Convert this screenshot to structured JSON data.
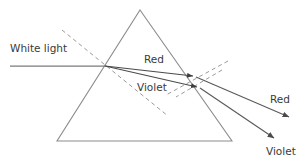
{
  "figure": {
    "type": "optics-ray-diagram",
    "width": 306,
    "height": 161,
    "background_color": "#ffffff"
  },
  "colors": {
    "prism_outline": "#8c8c8c",
    "ray_line": "#6b6b6b",
    "inner_ray_line": "#4a4a4a",
    "dashed_normal": "#9a9a9a",
    "text": "#3a3a3a"
  },
  "labels": {
    "white_light": "White light",
    "red_inside": "Red",
    "violet_inside": "Violet",
    "red_exit": "Red",
    "violet_exit": "Violet"
  },
  "label_positions": {
    "white_light": {
      "x": 10,
      "y": 52
    },
    "red_inside": {
      "x": 144,
      "y": 63
    },
    "violet_inside": {
      "x": 137,
      "y": 91
    },
    "red_exit": {
      "x": 270,
      "y": 103
    },
    "violet_exit": {
      "x": 266,
      "y": 155
    }
  },
  "prism": {
    "name": "triangular-prism",
    "apex": {
      "x": 140,
      "y": 10
    },
    "bottom_left": {
      "x": 57,
      "y": 141
    },
    "bottom_right": {
      "x": 232,
      "y": 141
    },
    "stroke_width": 1.1
  },
  "points": {
    "entry": {
      "x": 105,
      "y": 66
    },
    "exit_red": {
      "x": 196,
      "y": 77
    },
    "exit_violet": {
      "x": 200,
      "y": 88
    },
    "incident_start": {
      "x": 10,
      "y": 66
    },
    "red_arrow_end": {
      "x": 292,
      "y": 119
    },
    "violet_arrow_end": {
      "x": 277,
      "y": 140
    }
  },
  "rays": [
    {
      "name": "incident-white-light-ray",
      "from": {
        "x": 10,
        "y": 66
      },
      "to": {
        "x": 105,
        "y": 66
      },
      "style": "solid",
      "arrow": false
    },
    {
      "name": "refracted-red-ray-inside-prism",
      "from": {
        "x": 105,
        "y": 66
      },
      "to": {
        "x": 196,
        "y": 77
      },
      "style": "solid",
      "arrow": true
    },
    {
      "name": "refracted-violet-ray-inside-prism",
      "from": {
        "x": 105,
        "y": 66
      },
      "to": {
        "x": 200,
        "y": 88
      },
      "style": "solid",
      "arrow": true
    },
    {
      "name": "emergent-red-ray",
      "from": {
        "x": 196,
        "y": 77
      },
      "to": {
        "x": 292,
        "y": 119
      },
      "style": "solid",
      "arrow": true
    },
    {
      "name": "emergent-violet-ray",
      "from": {
        "x": 200,
        "y": 88
      },
      "to": {
        "x": 277,
        "y": 140
      },
      "style": "solid",
      "arrow": true
    }
  ],
  "normals": [
    {
      "name": "normal-at-entry-face",
      "from": {
        "x": 62,
        "y": 30
      },
      "to": {
        "x": 168,
        "y": 116
      },
      "style": "dashed"
    },
    {
      "name": "normal-at-exit-face-red",
      "from": {
        "x": 228,
        "y": 61
      },
      "to": {
        "x": 166,
        "y": 95
      },
      "style": "dashed"
    },
    {
      "name": "normal-at-exit-face-violet",
      "from": {
        "x": 222,
        "y": 70
      },
      "to": {
        "x": 176,
        "y": 97
      },
      "style": "dashed"
    }
  ]
}
